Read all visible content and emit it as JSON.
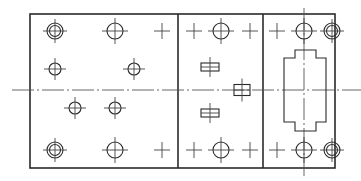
{
  "drawing": {
    "type": "engineering-plate-layout",
    "stroke_color": "#2a2a2a",
    "background": "#ffffff",
    "outer_frame": {
      "x": 30,
      "y": 14,
      "width": 305,
      "height": 154
    },
    "dividers_x": [
      178,
      263
    ],
    "centerline": {
      "y": 90,
      "x1": 12,
      "x2": 361
    },
    "vertical_centerline": {
      "x": 304,
      "y1": 8,
      "y2": 176
    },
    "features": {
      "double_holes": [
        {
          "cx": 55,
          "cy": 31
        },
        {
          "cx": 55,
          "cy": 150
        },
        {
          "cx": 332,
          "cy": 31
        },
        {
          "cx": 332,
          "cy": 150
        }
      ],
      "holes": [
        {
          "cx": 115,
          "cy": 31,
          "r": 8
        },
        {
          "cx": 221,
          "cy": 31,
          "r": 8
        },
        {
          "cx": 304,
          "cy": 31,
          "r": 8
        },
        {
          "cx": 55,
          "cy": 69,
          "r": 6
        },
        {
          "cx": 134,
          "cy": 69,
          "r": 6
        },
        {
          "cx": 75,
          "cy": 108,
          "r": 6
        },
        {
          "cx": 115,
          "cy": 108,
          "r": 6
        },
        {
          "cx": 115,
          "cy": 150,
          "r": 8
        },
        {
          "cx": 221,
          "cy": 150,
          "r": 8
        },
        {
          "cx": 304,
          "cy": 150,
          "r": 8
        }
      ],
      "crosses": [
        {
          "cx": 162,
          "cy": 31
        },
        {
          "cx": 194,
          "cy": 31
        },
        {
          "cx": 250,
          "cy": 31
        },
        {
          "cx": 277,
          "cy": 31
        },
        {
          "cx": 162,
          "cy": 150
        },
        {
          "cx": 194,
          "cy": 150
        },
        {
          "cx": 250,
          "cy": 150
        },
        {
          "cx": 277,
          "cy": 150
        }
      ],
      "slots": [
        {
          "cx": 210,
          "cy": 67,
          "w": 18,
          "h": 8
        },
        {
          "cx": 242,
          "cy": 90,
          "w": 16,
          "h": 11
        },
        {
          "cx": 210,
          "cy": 113,
          "w": 18,
          "h": 8
        }
      ],
      "stepped_cutout": {
        "outer": {
          "x1": 284,
          "x2": 326,
          "y1": 58,
          "y2": 122
        },
        "inner_step": {
          "x1": 295,
          "x2": 316,
          "y1": 50,
          "y2": 131
        }
      }
    }
  }
}
